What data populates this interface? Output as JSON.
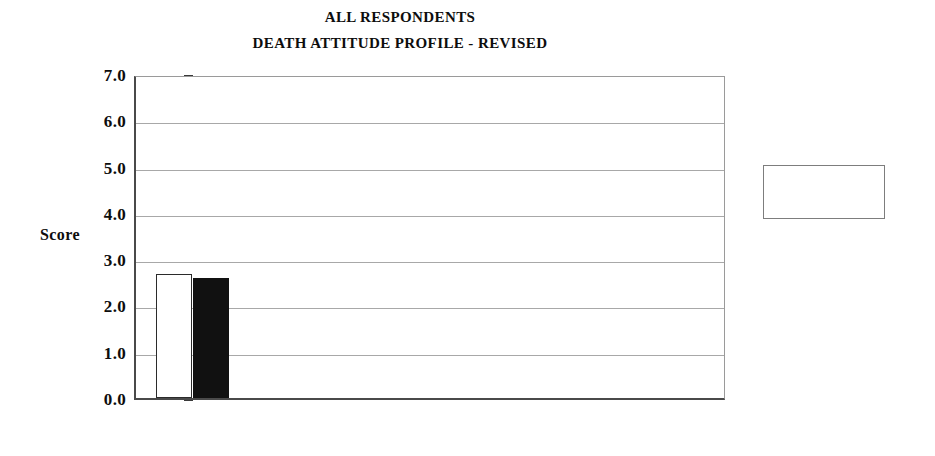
{
  "titles": {
    "line1": "ALL RESPONDENTS",
    "line2": "DEATH ATTITUDE PROFILE - REVISED"
  },
  "axis": {
    "y_title": "Score",
    "tick_labels": [
      "7.0",
      "6.0",
      "5.0",
      "4.0",
      "3.0",
      "2.0",
      "1.0",
      "0.0"
    ]
  },
  "legend": {
    "items": [
      {
        "label": "Time One",
        "swatch": "open-square",
        "color": "#ffffff"
      },
      {
        "label": "Time Two",
        "swatch": "filled-square",
        "color": "#111111"
      }
    ]
  },
  "categories_wrapped": [
    {
      "l1": "Fear of",
      "l2": "Death"
    },
    {
      "l1": "Death",
      "l2": "Avoidance"
    },
    {
      "l1": "Neutral",
      "l2": "Acceptance"
    },
    {
      "l1": "Approach",
      "l2": "Acceptance"
    },
    {
      "l1": "Escape",
      "l2": "Acceptance"
    }
  ],
  "chart_data": {
    "type": "bar",
    "title": "ALL RESPONDENTS\nDEATH ATTITUDE PROFILE - REVISED",
    "xlabel": "",
    "ylabel": "Score",
    "ylim": [
      0.0,
      7.0
    ],
    "ytick_step": 1.0,
    "yticks": [
      0.0,
      1.0,
      2.0,
      3.0,
      4.0,
      5.0,
      6.0,
      7.0
    ],
    "grid": true,
    "legend_position": "right",
    "categories": [
      "Fear of Death",
      "Death Avoidance",
      "Neutral Acceptance",
      "Approach Acceptance",
      "Escape Acceptance"
    ],
    "series": [
      {
        "name": "Time One",
        "color": "#ffffff",
        "values": [
          2.68,
          2.36,
          5.48,
          6.17,
          5.57
        ]
      },
      {
        "name": "Time Two",
        "color": "#111111",
        "values": [
          2.59,
          2.25,
          5.41,
          6.26,
          5.76
        ]
      }
    ]
  }
}
